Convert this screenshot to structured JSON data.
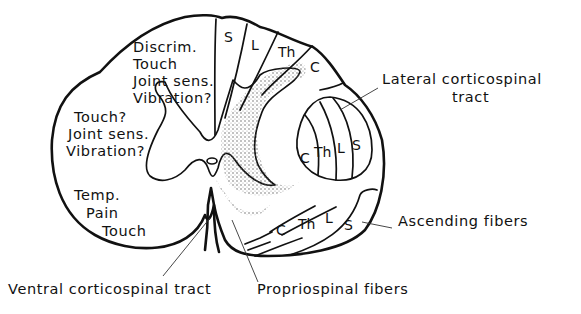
{
  "diagram": {
    "dorsal_column_labels": [
      "Discrim.",
      "Touch",
      "Joint sens.",
      "Vibration?"
    ],
    "dorsal_column_segments": [
      "S",
      "L",
      "Th",
      "C"
    ],
    "lateral_left_labels": [
      "Touch?",
      "Joint sens.",
      "Vibration?"
    ],
    "anterolateral_labels": [
      "Temp.",
      "Pain",
      "Touch"
    ],
    "lateral_corticospinal": {
      "label_line1": "Lateral corticospinal",
      "label_line2": "tract",
      "segments": [
        "C",
        "Th",
        "L",
        "S"
      ]
    },
    "ascending_fibers": {
      "label": "Ascending fibers",
      "segments": [
        "C",
        "Th",
        "L",
        "S"
      ]
    },
    "ventral_corticospinal": {
      "label": "Ventral corticospinal tract"
    },
    "propriospinal": {
      "label": "Propriospinal fibers"
    }
  }
}
